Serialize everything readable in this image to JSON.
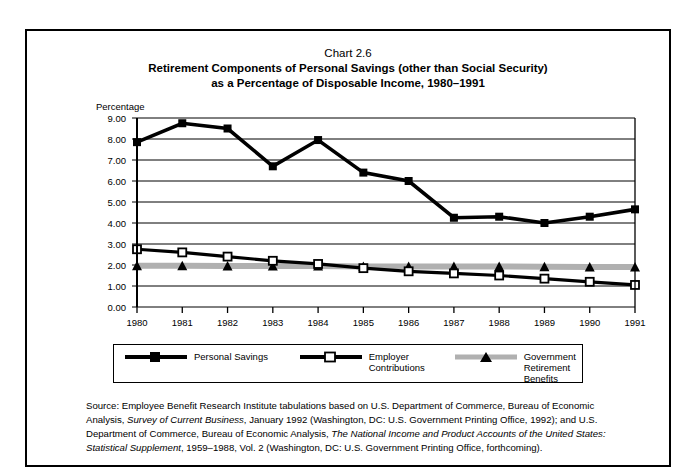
{
  "title": {
    "chart_number": "Chart 2.6",
    "line1": "Retirement Components of Personal Savings (other than Social Security)",
    "line2": "as a Percentage of Disposable Income, 1980–1991"
  },
  "axis_title": "Percentage",
  "legend": [
    {
      "label": "Personal Savings",
      "marker": "filled-square-marker",
      "color": "#000000"
    },
    {
      "label": "Employer\nContributions",
      "marker": "open-square-marker",
      "color": "#000000"
    },
    {
      "label": "Government\nRetirement Benefits",
      "marker": "triangle-marker",
      "color": "#000000",
      "line_color": "#a8a8a8"
    }
  ],
  "source": {
    "prefix": "Source: Employee Benefit Research Institute tabulations based on U.S. Department of Commerce, Bureau of Economic Analysis, ",
    "italic1": "Survey of Current Business",
    "mid": ", January 1992 (Washington, DC: U.S. Government Printing Office, 1992); and U.S. Department of Commerce, Bureau of Economic Analysis, ",
    "italic2": "The National Income and Product Accounts of the United States: Statistical Supplement",
    "suffix": ", 1959–1988, Vol. 2 (Washington, DC: U.S. Government Printing Office, forthcoming)."
  },
  "chart_data": {
    "type": "line",
    "title": "Retirement Components of Personal Savings (other than Social Security) as a Percentage of Disposable Income, 1980–1991",
    "xlabel": "",
    "ylabel": "Percentage",
    "ylim": [
      0,
      9
    ],
    "yticks": [
      "0.00",
      "1.00",
      "2.00",
      "3.00",
      "4.00",
      "5.00",
      "6.00",
      "7.00",
      "8.00",
      "9.00"
    ],
    "ytick_values": [
      0,
      1,
      2,
      3,
      4,
      5,
      6,
      7,
      8,
      9
    ],
    "grid": true,
    "legend_position": "bottom",
    "categories": [
      "1980",
      "1981",
      "1982",
      "1983",
      "1984",
      "1985",
      "1986",
      "1987",
      "1988",
      "1989",
      "1990",
      "1991"
    ],
    "series": [
      {
        "name": "Personal Savings",
        "marker": "filled-square",
        "values": [
          7.85,
          8.75,
          8.5,
          6.7,
          7.95,
          6.4,
          6.0,
          4.25,
          4.3,
          4.0,
          4.3,
          4.65
        ]
      },
      {
        "name": "Employer Contributions",
        "marker": "open-square",
        "values": [
          2.75,
          2.6,
          2.4,
          2.2,
          2.05,
          1.85,
          1.7,
          1.6,
          1.5,
          1.35,
          1.2,
          1.05
        ]
      },
      {
        "name": "Government Retirement Benefits",
        "marker": "triangle",
        "values": [
          1.97,
          1.97,
          1.95,
          1.95,
          1.95,
          1.93,
          1.93,
          1.93,
          1.93,
          1.92,
          1.9,
          1.9
        ]
      }
    ]
  }
}
